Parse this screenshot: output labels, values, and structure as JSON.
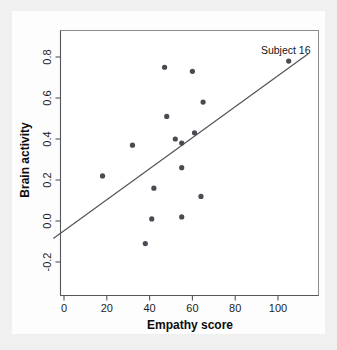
{
  "chart_data": {
    "type": "scatter",
    "title": "",
    "xlabel": "Empathy score",
    "ylabel": "Brain activity",
    "xlim": [
      -5,
      114
    ],
    "ylim": [
      -0.28,
      0.92
    ],
    "xticks": [
      0,
      20,
      40,
      60,
      80,
      100
    ],
    "xtick_labels": [
      "0",
      "20",
      "40",
      "60",
      "80",
      "100"
    ],
    "yticks": [
      -0.2,
      0.0,
      0.2,
      0.4,
      0.6,
      0.8
    ],
    "ytick_labels": [
      "-0.2",
      "0.0",
      "0.2",
      "0.4",
      "0.6",
      "0.8"
    ],
    "grid": false,
    "legend": false,
    "point_color": "#4a4a52",
    "line_color": "#53535b",
    "x": [
      18,
      32,
      38,
      41,
      42,
      47,
      48,
      52,
      55,
      55,
      55,
      60,
      61,
      64,
      65,
      105
    ],
    "y": [
      0.22,
      0.37,
      -0.11,
      0.01,
      0.16,
      0.75,
      0.51,
      0.4,
      0.38,
      0.26,
      0.02,
      0.73,
      0.43,
      0.12,
      0.58,
      0.78
    ],
    "points": [
      {
        "x": 18,
        "y": 0.22
      },
      {
        "x": 32,
        "y": 0.37
      },
      {
        "x": 38,
        "y": -0.11
      },
      {
        "x": 41,
        "y": 0.01
      },
      {
        "x": 42,
        "y": 0.16
      },
      {
        "x": 47,
        "y": 0.75
      },
      {
        "x": 48,
        "y": 0.51
      },
      {
        "x": 52,
        "y": 0.4
      },
      {
        "x": 55,
        "y": 0.38
      },
      {
        "x": 55,
        "y": 0.26
      },
      {
        "x": 55,
        "y": 0.02
      },
      {
        "x": 60,
        "y": 0.73
      },
      {
        "x": 61,
        "y": 0.43
      },
      {
        "x": 64,
        "y": 0.12
      },
      {
        "x": 65,
        "y": 0.58
      },
      {
        "x": 105,
        "y": 0.78,
        "label": "Subject 16"
      }
    ],
    "trendline": {
      "type": "linear-regression",
      "x_start": -5,
      "y_start": -0.085,
      "x_end": 114,
      "y_end": 0.815
    },
    "annotations": [
      {
        "text": "Subject 16",
        "x": 105,
        "y": 0.78
      }
    ]
  }
}
